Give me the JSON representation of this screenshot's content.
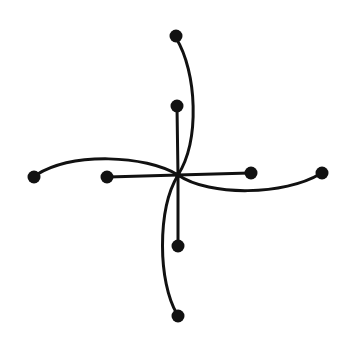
{
  "figure": {
    "background_color": "#ffffff",
    "stroke_color": "#111111",
    "node_fill_color": "#111111",
    "stroke_width": 3,
    "node_radius": 6.5,
    "hub_radius": 3,
    "canvas": {
      "width": 342,
      "height": 344
    },
    "center": {
      "x": 178,
      "y": 175
    }
  },
  "chart_data": {
    "type": "scatter",
    "xlabel": "",
    "ylabel": "",
    "xlim": [
      0,
      342
    ],
    "ylim": [
      0,
      344
    ],
    "grid": false,
    "legend": "none",
    "hub": {
      "id": "center",
      "x": 178,
      "y": 175
    },
    "nodes": [
      {
        "id": "top-outer",
        "label": "top outer node",
        "x": 176,
        "y": 36,
        "edge": "curved",
        "radius": 6.5
      },
      {
        "id": "top-inner",
        "label": "top inner node",
        "x": 177,
        "y": 106,
        "edge": "straight",
        "radius": 6.5
      },
      {
        "id": "left-outer",
        "label": "left outer node",
        "x": 34,
        "y": 177,
        "edge": "curved",
        "radius": 6.5
      },
      {
        "id": "left-inner",
        "label": "left inner node",
        "x": 107,
        "y": 177,
        "edge": "straight",
        "radius": 6.5
      },
      {
        "id": "right-inner",
        "label": "right inner node",
        "x": 251,
        "y": 173,
        "edge": "straight",
        "radius": 6.5
      },
      {
        "id": "right-outer",
        "label": "right outer node",
        "x": 322,
        "y": 173,
        "edge": "curved",
        "radius": 6.5
      },
      {
        "id": "bottom-inner",
        "label": "bottom inner node",
        "x": 178,
        "y": 246,
        "edge": "straight",
        "radius": 6.5
      },
      {
        "id": "bottom-outer",
        "label": "bottom outer node",
        "x": 178,
        "y": 316,
        "edge": "curved",
        "radius": 6.5
      }
    ],
    "edges": [
      {
        "id": "edge-top-curve",
        "from": "center",
        "to": "top-outer",
        "kind": "curved",
        "bow_direction": "right",
        "path": "M 178 175 C 200 140 197 72 176 38"
      },
      {
        "id": "edge-top-straight",
        "from": "center",
        "to": "top-inner",
        "kind": "straight",
        "path": "M 178 175 L 177 107"
      },
      {
        "id": "edge-left-curve",
        "from": "center",
        "to": "left-outer",
        "kind": "curved",
        "bow_direction": "up",
        "path": "M 178 175 C 145 155 73 152 36 175"
      },
      {
        "id": "edge-left-straight",
        "from": "center",
        "to": "left-inner",
        "kind": "straight",
        "path": "M 178 175 L 108 177"
      },
      {
        "id": "edge-right-straight",
        "from": "center",
        "to": "right-inner",
        "kind": "straight",
        "path": "M 178 175 L 250 173"
      },
      {
        "id": "edge-right-curve",
        "from": "center",
        "to": "right-outer",
        "kind": "curved",
        "bow_direction": "down",
        "path": "M 178 175 C 210 197 285 195 320 174"
      },
      {
        "id": "edge-bottom-straight",
        "from": "center",
        "to": "bottom-inner",
        "kind": "straight",
        "path": "M 178 175 L 178 245"
      },
      {
        "id": "edge-bottom-curve",
        "from": "center",
        "to": "bottom-outer",
        "kind": "curved",
        "bow_direction": "left",
        "path": "M 178 175 C 157 210 158 282 177 314"
      }
    ]
  }
}
